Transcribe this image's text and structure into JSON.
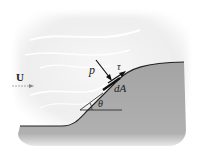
{
  "diagram": {
    "labels": {
      "velocity": "U",
      "pressure": "p",
      "shear": "τ",
      "area": "dA",
      "angle": "θ"
    },
    "colors": {
      "fluid": "#f2f2f2",
      "fluid_streaks": "#ffffff",
      "solid": "#a9a9a9",
      "outline": "#222222",
      "arrow_flow": "#888888"
    }
  }
}
